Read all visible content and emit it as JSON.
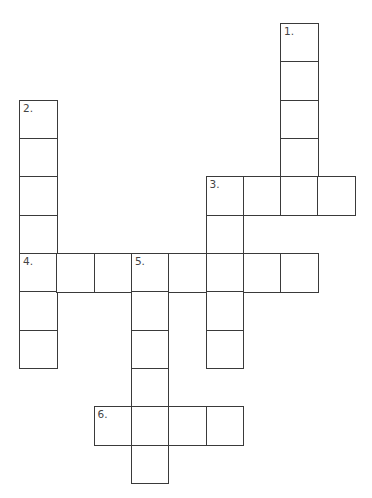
{
  "grid": {
    "origin_x": 19,
    "origin_y": 23,
    "cell_w": 37.3,
    "cell_h": 38.33,
    "border_color": "#3a3a3a"
  },
  "entries": [
    {
      "number": "1.",
      "direction": "down",
      "col": 7,
      "row": 0,
      "length": 5
    },
    {
      "number": "2.",
      "direction": "down",
      "col": 0,
      "row": 2,
      "length": 7
    },
    {
      "number": "3.",
      "direction": "across",
      "col": 5,
      "row": 4,
      "length": 4
    },
    {
      "number": "3.",
      "direction": "down",
      "col": 5,
      "row": 4,
      "length": 5
    },
    {
      "number": "4.",
      "direction": "across",
      "col": 0,
      "row": 6,
      "length": 8
    },
    {
      "number": "5.",
      "direction": "down",
      "col": 3,
      "row": 6,
      "length": 6
    },
    {
      "number": "6.",
      "direction": "across",
      "col": 2,
      "row": 10,
      "length": 4
    }
  ]
}
